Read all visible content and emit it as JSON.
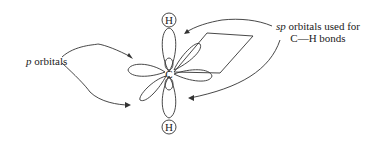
{
  "diagram": {
    "atoms": {
      "center": "C",
      "top": "H",
      "bottom": "H"
    },
    "labels": {
      "p_orbitals": {
        "italic": "p",
        "rest": " orbitals"
      },
      "sp_orbitals": {
        "italic": "sp",
        "rest": " orbitals used for",
        "line2": "C—H bonds"
      }
    },
    "colors": {
      "stroke": "#333333",
      "text": "#222222",
      "background": "#ffffff"
    }
  }
}
